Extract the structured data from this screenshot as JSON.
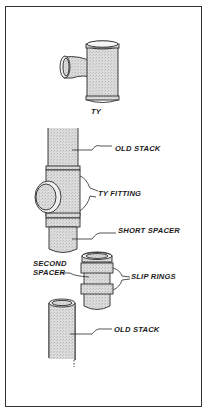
{
  "figure": {
    "title_partial": "...pping...",
    "labels": {
      "ty": "TY",
      "old_stack_top": "OLD STACK",
      "ty_fitting": "TY FITTING",
      "short_spacer": "SHORT SPACER",
      "second_spacer_line1": "SECOND",
      "second_spacer_line2": "SPACER",
      "slip_rings": "SLIP RINGS",
      "old_stack_bottom": "OLD STACK"
    },
    "colors": {
      "line": "#2a2a2a",
      "pipe_fill": "#d4d4d4",
      "background": "#ffffff"
    }
  }
}
